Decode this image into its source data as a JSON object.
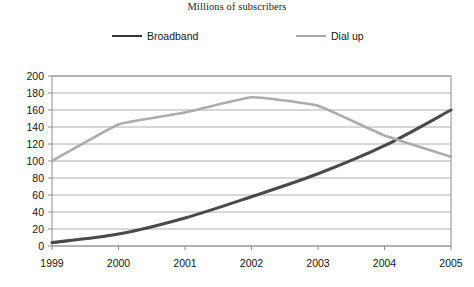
{
  "chart_data": {
    "type": "line",
    "title": "Millions of subscribers",
    "xlabel": "",
    "ylabel": "",
    "categories": [
      "1999",
      "2000",
      "2001",
      "2002",
      "2003",
      "2004",
      "2005"
    ],
    "x": [
      1999,
      2000,
      2001,
      2002,
      2003,
      2004,
      2005
    ],
    "series": [
      {
        "name": "Broadband",
        "color": "#4a4a4a",
        "values": [
          4,
          14,
          33,
          58,
          85,
          118,
          160
        ]
      },
      {
        "name": "Dial up",
        "color": "#acacac",
        "values": [
          100,
          143,
          157,
          175,
          165,
          130,
          105
        ]
      }
    ],
    "ylim": [
      0,
      200
    ],
    "yticks": [
      0,
      20,
      40,
      60,
      80,
      100,
      120,
      140,
      160,
      180,
      200
    ],
    "ytick_labels": [
      "0",
      "20",
      "40",
      "60",
      "80",
      "100",
      "120",
      "140",
      "160",
      "180",
      "200"
    ],
    "grid": true,
    "grid_axis": "y",
    "legend_position": "top",
    "legend": [
      {
        "label": "Broadband",
        "color": "#4a4a4a"
      },
      {
        "label": "Dial up",
        "color": "#acacac"
      }
    ]
  }
}
